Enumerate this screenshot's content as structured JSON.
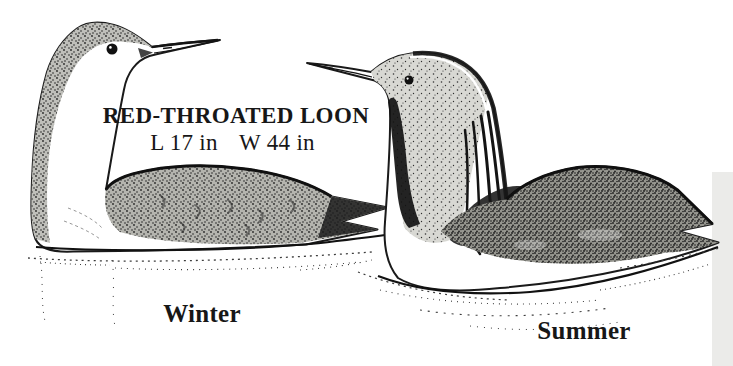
{
  "figure": {
    "title": "RED-THROATED LOON",
    "length": "L 17 in",
    "wingspan": "W 44 in",
    "birds": [
      {
        "label": "Winter",
        "illustration": "loon swimming, facing right, white face and throat, stippled gray crown-nape and speckled back"
      },
      {
        "label": "Summer",
        "illustration": "loon swimming, facing left, gray head, dark throat patch, striped nape, dark back"
      }
    ]
  },
  "colors": {
    "ink": "#1a1a1a",
    "paper": "#ffffff",
    "scan_edge": "#ebebe9"
  }
}
